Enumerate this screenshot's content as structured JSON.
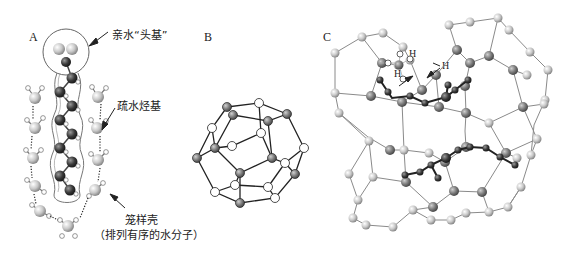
{
  "figure": {
    "panels": [
      {
        "id": "A",
        "label": "A"
      },
      {
        "id": "B",
        "label": "B"
      },
      {
        "id": "C",
        "label": "C"
      }
    ],
    "panel_a": {
      "annotations": {
        "head_group": "亲水“头基”",
        "hydrocarbon": "疏水烃基",
        "cage_shell": "笼样壳",
        "cage_shell_note": "（排列有序的水分子）"
      }
    },
    "panel_c": {
      "h_labels": [
        "H",
        "H",
        "H"
      ]
    },
    "colors": {
      "dark_atom": "#3a3a3a",
      "mid_atom": "#7a7a7a",
      "light_atom": "#cfcfcf",
      "hydrogen": "#ffffff",
      "bond": "#333333",
      "cage_bond": "#888888"
    }
  }
}
